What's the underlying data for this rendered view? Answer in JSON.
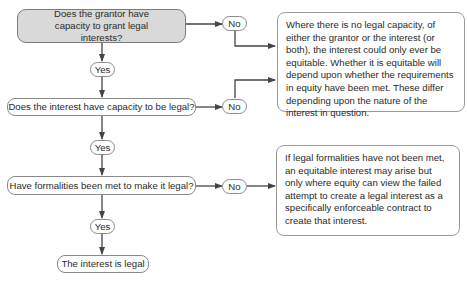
{
  "diagram": {
    "questions": [
      {
        "id": "q1",
        "text": "Does the grantor have capacity to grant legal interests?"
      },
      {
        "id": "q2",
        "text": "Does the interest have capacity to be legal?"
      },
      {
        "id": "q3",
        "text": "Have formalities been met to make it legal?"
      }
    ],
    "yes_labels": [
      "Yes",
      "Yes",
      "Yes"
    ],
    "no_labels": [
      "No",
      "No",
      "No"
    ],
    "result": "The interest is legal",
    "notes": [
      {
        "id": "capacity-note",
        "text": "Where there is no legal capacity, of either the grantor or the interest (or both), the interest could only ever be equitable. Whether it is equitable will depend upon whether the requirements in equity have been met. These differ depending upon the nature of the interest in question."
      },
      {
        "id": "formalities-note",
        "text": "If legal formalities have not been met, an equitable interest may arise but only where equity can view the failed attempt to create a legal interest as a specifically enforceable contract to create that interest."
      }
    ],
    "colors": {
      "start_fill": "#d9d9d9",
      "stroke": "#8a8a8a",
      "arrow": "#444444"
    }
  }
}
